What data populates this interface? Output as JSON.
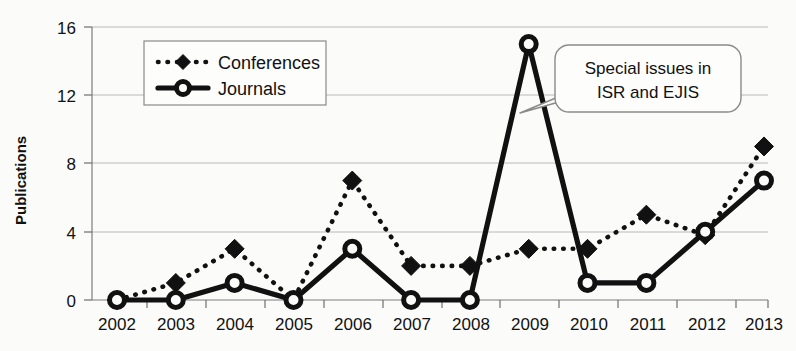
{
  "chart_data": {
    "type": "line",
    "title": "",
    "xlabel": "",
    "ylabel": "Publications",
    "categories": [
      "2002",
      "2003",
      "2004",
      "2005",
      "2006",
      "2007",
      "2008",
      "2009",
      "2010",
      "2011",
      "2012",
      "2013"
    ],
    "series": [
      {
        "name": "Conferences",
        "values": [
          0,
          1,
          3,
          0,
          7,
          2,
          2,
          3,
          3,
          5,
          3.8,
          9
        ],
        "marker": "diamond",
        "line_style": "dotted"
      },
      {
        "name": "Journals",
        "values": [
          0,
          0,
          1,
          0,
          3,
          0,
          0,
          15,
          1,
          1,
          4,
          7
        ],
        "marker": "circle-open",
        "line_style": "solid"
      }
    ],
    "ylim": [
      0,
      16
    ],
    "yticks": [
      0,
      4,
      8,
      12,
      16
    ],
    "ytick_labels": [
      "0",
      "4",
      "8",
      "12",
      "16"
    ],
    "grid": true,
    "legend_position": "top-left",
    "annotations": [
      {
        "name": "special-issues-callout",
        "line1": "Special issues in",
        "line2": "ISR and EJIS",
        "points_to": "2009"
      }
    ]
  },
  "legend": {
    "entries": [
      {
        "label": "Conferences"
      },
      {
        "label": "Journals"
      }
    ]
  },
  "axis": {
    "y_title": "Publications",
    "y_ticks": [
      "0",
      "4",
      "8",
      "12",
      "16"
    ],
    "x_ticks": [
      "2002",
      "2003",
      "2004",
      "2005",
      "2006",
      "2007",
      "2008",
      "2009",
      "2010",
      "2011",
      "2012",
      "2013"
    ]
  },
  "callout": {
    "line1": "Special issues in",
    "line2": "ISR and EJIS"
  },
  "colors": {
    "ink": "#111111",
    "grid": "#b9b9b9",
    "background": "#fbfbfa",
    "box_fill": "#fdfdfc",
    "box_stroke": "#8a8a8a"
  }
}
